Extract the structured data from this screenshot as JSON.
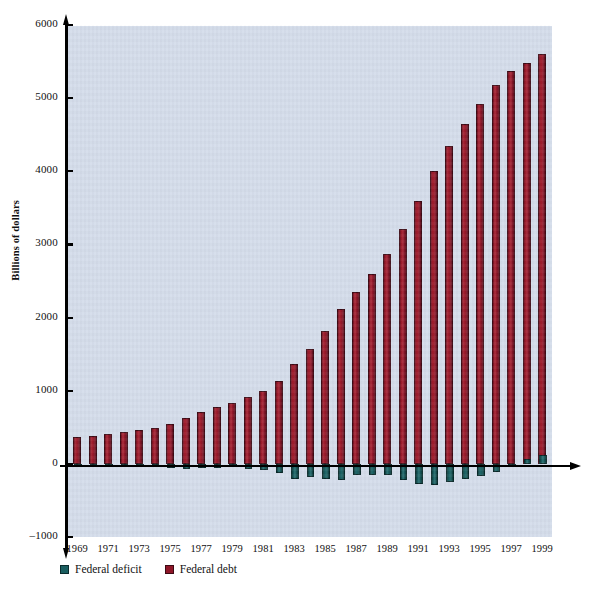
{
  "chart_data": {
    "type": "bar",
    "title": "",
    "subtitle": "",
    "xlabel": "",
    "ylabel": "Billions of dollars",
    "ylim": [
      -1000,
      6000
    ],
    "ytick_values": [
      6000,
      5000,
      4000,
      3000,
      2000,
      1000,
      0,
      -1000
    ],
    "ytick_labels": [
      "6000",
      "5000",
      "4000",
      "3000",
      "2000",
      "1000",
      "0",
      "–1000"
    ],
    "grid": false,
    "legend_position": "below-axis-left",
    "x": [
      1969,
      1970,
      1971,
      1972,
      1973,
      1974,
      1975,
      1976,
      1977,
      1978,
      1979,
      1980,
      1981,
      1982,
      1983,
      1984,
      1985,
      1986,
      1987,
      1988,
      1989,
      1990,
      1991,
      1992,
      1993,
      1994,
      1995,
      1996,
      1997,
      1998,
      1999
    ],
    "xtick_labels": [
      "1969",
      "1971",
      "1973",
      "1975",
      "1977",
      "1979",
      "1981",
      "1983",
      "1985",
      "1987",
      "1989",
      "1991",
      "1993",
      "1995",
      "1997",
      "1999"
    ],
    "series": [
      {
        "name": "Federal debt",
        "color": "#8e1628",
        "values": [
          366,
          381,
          408,
          436,
          466,
          484,
          541,
          629,
          706,
          777,
          829,
          909,
          995,
          1137,
          1372,
          1565,
          1818,
          2120,
          2346,
          2601,
          2868,
          3206,
          3598,
          4002,
          4351,
          4643,
          4921,
          5182,
          5369,
          5478,
          5606
        ]
      },
      {
        "name": "Federal deficit",
        "color": "#1a5e60",
        "values": [
          -3,
          3,
          23,
          23,
          15,
          6,
          53,
          74,
          54,
          59,
          40,
          74,
          79,
          128,
          208,
          185,
          212,
          221,
          150,
          155,
          152,
          221,
          269,
          290,
          255,
          203,
          164,
          107,
          22,
          -69,
          -126
        ]
      }
    ]
  },
  "legend": {
    "items": [
      {
        "label": "Federal deficit",
        "icon": "square-swatch-icon",
        "color": "#1a5e60"
      },
      {
        "label": "Federal debt",
        "icon": "square-swatch-icon",
        "color": "#8e1628"
      }
    ]
  },
  "colors": {
    "plot_background": "#d3dcea",
    "page_background": "#ffffff",
    "axis": "#000000",
    "debt_bar": "#8e1628",
    "deficit_bar": "#1a5e60"
  }
}
